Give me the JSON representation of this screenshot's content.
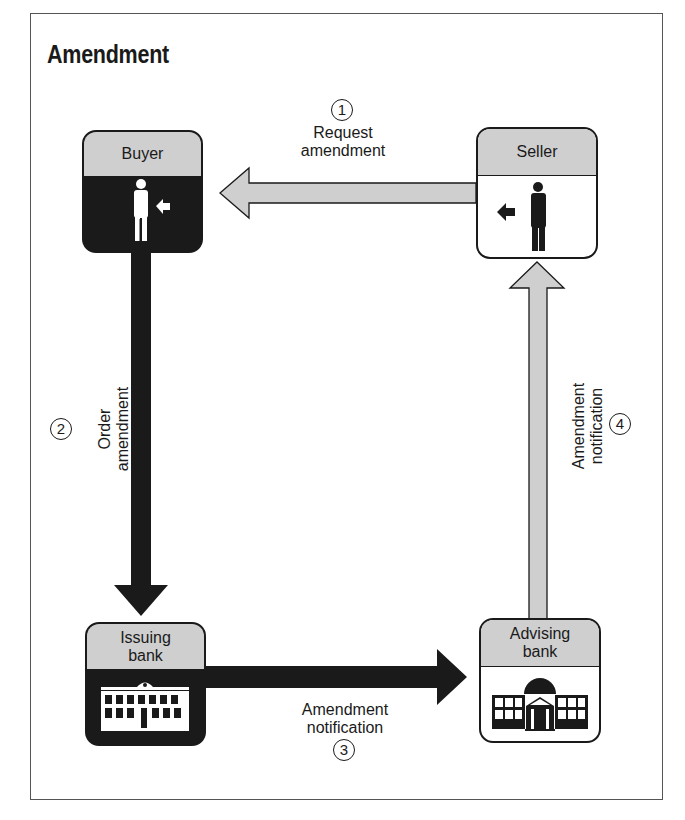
{
  "title": "Amendment",
  "colors": {
    "dark": "#1a1a1a",
    "header_gray": "#cfcfcf",
    "light_arrow": "#cfcfcf",
    "background": "#ffffff"
  },
  "nodes": {
    "buyer": {
      "label": "Buyer",
      "icon": "person-icon",
      "theme": "dark"
    },
    "seller": {
      "label": "Seller",
      "icon": "person-icon",
      "theme": "light"
    },
    "issuing_bank": {
      "label_line1": "Issuing",
      "label_line2": "bank",
      "icon": "bank-building-icon",
      "theme": "dark"
    },
    "advising_bank": {
      "label_line1": "Advising",
      "label_line2": "bank",
      "icon": "domed-bank-building-icon",
      "theme": "light"
    }
  },
  "steps": [
    {
      "number": "1",
      "line1": "Request",
      "line2": "amendment",
      "from": "Seller",
      "to": "Buyer",
      "arrow_style": "gray"
    },
    {
      "number": "2",
      "line1": "Order",
      "line2": "amendment",
      "from": "Buyer",
      "to": "Issuing bank",
      "arrow_style": "black"
    },
    {
      "number": "3",
      "line1": "Amendment",
      "line2": "notification",
      "from": "Issuing bank",
      "to": "Advising bank",
      "arrow_style": "black"
    },
    {
      "number": "4",
      "line1": "Amendment",
      "line2": "notification",
      "from": "Advising bank",
      "to": "Seller",
      "arrow_style": "gray"
    }
  ]
}
